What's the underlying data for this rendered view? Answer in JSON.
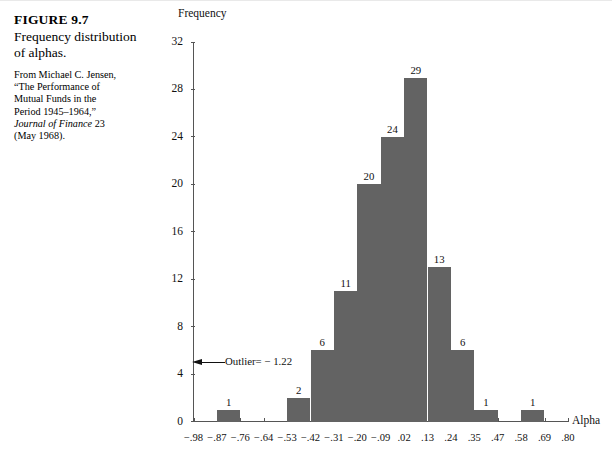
{
  "caption": {
    "figure_number": "FIGURE 9.7",
    "title": "Frequency distribution of alphas.",
    "source_line_1": "From Michael C. Jensen,",
    "source_line_2": "“The Performance of",
    "source_line_3": "Mutual Funds in the",
    "source_line_4": "Period 1945–1964,”",
    "source_journal": "Journal of Finance",
    "source_volume": " 23",
    "source_line_6": "(May 1968)."
  },
  "annotation": {
    "outlier_label": "Outlier= − 1.22"
  },
  "colors": {
    "bar_fill": "#636363",
    "axis": "#555555",
    "text": "#111111"
  },
  "chart_data": {
    "type": "bar",
    "title": "",
    "xlabel": "Alpha",
    "ylabel": "Frequency",
    "ylim": [
      0,
      32
    ],
    "yticks": [
      0,
      4,
      8,
      12,
      16,
      20,
      24,
      28,
      32
    ],
    "xticks": [
      "−.98",
      "−.87",
      "−.76",
      "−.64",
      "−.53",
      "−.42",
      "−.31",
      "−.20",
      "−.09",
      ".02",
      ".13",
      ".24",
      ".35",
      ".47",
      ".58",
      ".69",
      ".80"
    ],
    "grid": false,
    "legend": null,
    "bin_edges": [
      -0.98,
      -0.87,
      -0.76,
      -0.64,
      -0.53,
      -0.42,
      -0.31,
      -0.2,
      -0.09,
      0.02,
      0.13,
      0.24,
      0.35,
      0.47,
      0.58,
      0.69,
      0.8
    ],
    "values": [
      0,
      1,
      0,
      0,
      2,
      6,
      11,
      20,
      24,
      29,
      13,
      6,
      1,
      0,
      1,
      0
    ],
    "bars": [
      {
        "index": 1,
        "bin": "−.87 to −.76",
        "value": 1,
        "label": "1"
      },
      {
        "index": 4,
        "bin": "−.53 to −.42",
        "value": 2,
        "label": "2"
      },
      {
        "index": 5,
        "bin": "−.42 to −.31",
        "value": 6,
        "label": "6"
      },
      {
        "index": 6,
        "bin": "−.31 to −.20",
        "value": 11,
        "label": "11"
      },
      {
        "index": 7,
        "bin": "−.20 to −.09",
        "value": 20,
        "label": "20"
      },
      {
        "index": 8,
        "bin": "−.09 to .02",
        "value": 24,
        "label": "24"
      },
      {
        "index": 9,
        "bin": ".02 to .13",
        "value": 29,
        "label": "29"
      },
      {
        "index": 10,
        "bin": ".13 to .24",
        "value": 13,
        "label": "13"
      },
      {
        "index": 11,
        "bin": ".24 to .35",
        "value": 6,
        "label": "6"
      },
      {
        "index": 12,
        "bin": ".35 to .47",
        "value": 1,
        "label": "1"
      },
      {
        "index": 14,
        "bin": ".58 to .69",
        "value": 1,
        "label": "1"
      }
    ],
    "annotations": [
      {
        "text": "Outlier= − 1.22",
        "points_to_y": 5,
        "direction": "left"
      }
    ]
  }
}
